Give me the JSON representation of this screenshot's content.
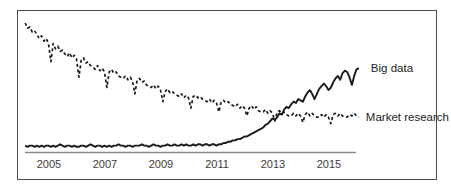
{
  "window": {
    "background": "#ffffff",
    "frame_border_color": "#4a4a4a"
  },
  "chart_data": {
    "type": "line",
    "title": "",
    "grid": false,
    "legend_position": "labels-at-line-ends",
    "axis_line_color": "#8a8a8a",
    "line_color": "#1c1c1c",
    "x_axis": {
      "tick_years": [
        2005,
        2007,
        2009,
        2011,
        2013,
        2015
      ],
      "tick_labels": [
        "2005",
        "2007",
        "2009",
        "2011",
        "2013",
        "2015"
      ],
      "range_years": [
        2004.15,
        2016.1
      ]
    },
    "y_axis": {
      "range": [
        0,
        100
      ],
      "visible": false
    },
    "series": [
      {
        "name": "Big data",
        "label": "Big data",
        "style": "solid",
        "start_year": 2004.15,
        "interval_months": 1,
        "values": [
          5,
          4,
          5,
          5,
          4,
          5,
          4,
          5,
          4,
          5,
          5,
          4,
          5,
          4,
          5,
          6,
          5,
          4,
          5,
          5,
          4,
          5,
          4,
          4,
          5,
          5,
          4,
          5,
          6,
          5,
          4,
          5,
          5,
          4,
          5,
          4,
          5,
          4,
          5,
          5,
          6,
          5,
          5,
          4,
          5,
          5,
          4,
          5,
          5,
          5,
          6,
          5,
          5,
          4,
          5,
          6,
          5,
          5,
          4,
          5,
          5,
          6,
          5,
          5,
          6,
          5,
          5,
          6,
          5,
          6,
          5,
          5,
          6,
          5,
          6,
          6,
          5,
          6,
          6,
          5,
          6,
          6,
          5,
          6,
          6,
          7,
          7,
          8,
          8,
          9,
          9,
          10,
          10,
          11,
          12,
          12,
          13,
          14,
          15,
          16,
          17,
          18,
          19,
          21,
          22,
          24,
          26,
          25,
          27,
          30,
          29,
          33,
          35,
          34,
          37,
          39,
          38,
          41,
          40,
          39,
          43,
          46,
          48,
          45,
          41,
          45,
          49,
          51,
          53,
          51,
          48,
          50,
          54,
          57,
          59,
          56,
          61,
          63,
          62,
          58,
          52,
          59,
          64,
          65
        ]
      },
      {
        "name": "Market research",
        "label": "Market research",
        "style": "dashed",
        "start_year": 2004.15,
        "interval_months": 1,
        "values": [
          100,
          96,
          97,
          93,
          94,
          91,
          88,
          90,
          86,
          88,
          84,
          70,
          84,
          80,
          82,
          78,
          79,
          76,
          74,
          77,
          73,
          75,
          72,
          58,
          71,
          73,
          69,
          70,
          67,
          66,
          64,
          67,
          63,
          65,
          62,
          50,
          62,
          64,
          61,
          62,
          59,
          58,
          57,
          59,
          56,
          58,
          55,
          45,
          56,
          57,
          54,
          55,
          52,
          51,
          50,
          52,
          49,
          51,
          48,
          39,
          47,
          49,
          46,
          47,
          45,
          44,
          43,
          45,
          42,
          44,
          42,
          34,
          43,
          44,
          42,
          43,
          41,
          40,
          39,
          41,
          38,
          40,
          38,
          31,
          39,
          40,
          38,
          39,
          37,
          36,
          35,
          37,
          34,
          36,
          34,
          28,
          34,
          36,
          33,
          35,
          32,
          31,
          31,
          33,
          30,
          32,
          30,
          24,
          31,
          32,
          30,
          31,
          29,
          28,
          28,
          30,
          28,
          30,
          28,
          23,
          29,
          31,
          28,
          30,
          28,
          27,
          27,
          29,
          27,
          29,
          27,
          22,
          29,
          30,
          28,
          30,
          28,
          27,
          27,
          29,
          28,
          30,
          28,
          27
        ]
      }
    ]
  }
}
